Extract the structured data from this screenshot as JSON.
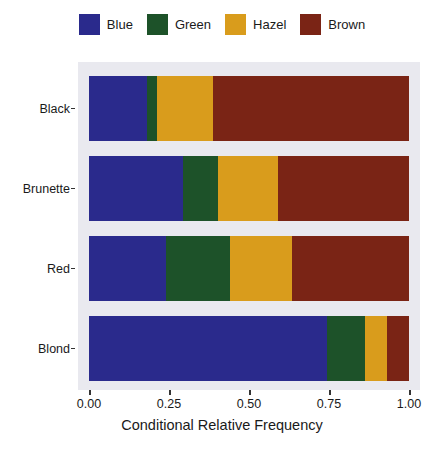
{
  "chart_data": {
    "type": "bar",
    "orientation": "horizontal",
    "stacked": true,
    "normalized": true,
    "title": "",
    "xlabel": "Conditional Relative Frequency",
    "ylabel": "",
    "xlim": [
      0.0,
      1.0
    ],
    "grid": false,
    "legend_position": "top",
    "categories": [
      "Black",
      "Brunette",
      "Red",
      "Blond"
    ],
    "category_order_top_to_bottom": [
      "Black",
      "Brunette",
      "Red",
      "Blond"
    ],
    "xticks": [
      0.0,
      0.25,
      0.5,
      0.75,
      1.0
    ],
    "xtick_labels": [
      "0.00",
      "0.25",
      "0.50",
      "0.75",
      "1.00"
    ],
    "series": [
      {
        "name": "Blue",
        "color": "#2a2a8c",
        "values": [
          0.18,
          0.294,
          0.241,
          0.744
        ]
      },
      {
        "name": "Green",
        "color": "#1d5229",
        "values": [
          0.034,
          0.109,
          0.2,
          0.119
        ]
      },
      {
        "name": "Hazel",
        "color": "#d99c1c",
        "values": [
          0.172,
          0.188,
          0.194,
          0.069
        ]
      },
      {
        "name": "Brown",
        "color": "#7a2415",
        "values": [
          0.614,
          0.409,
          0.365,
          0.068
        ]
      }
    ],
    "panel_background": "#e9e9ef",
    "figure_background": "#ffffff",
    "text_color": "#1a1a1a"
  },
  "legend": {
    "items": [
      {
        "label": "Blue",
        "color": "#2a2a8c"
      },
      {
        "label": "Green",
        "color": "#1d5229"
      },
      {
        "label": "Hazel",
        "color": "#d99c1c"
      },
      {
        "label": "Brown",
        "color": "#7a2415"
      }
    ]
  },
  "axes": {
    "x": {
      "label": "Conditional Relative Frequency",
      "tick_labels": [
        "0.00",
        "0.25",
        "0.50",
        "0.75",
        "1.00"
      ]
    },
    "y": {
      "label": "",
      "tick_labels": [
        "Black",
        "Brunette",
        "Red",
        "Blond"
      ]
    }
  }
}
